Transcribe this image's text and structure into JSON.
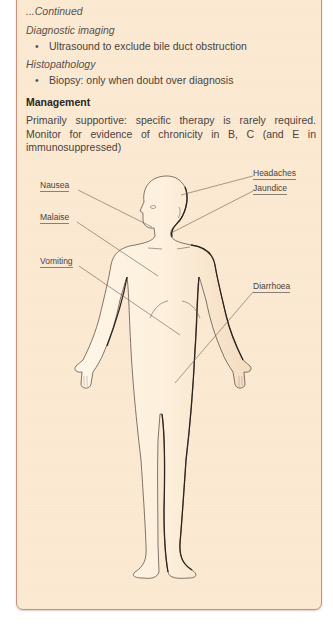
{
  "panel": {
    "continued": "...Continued",
    "sections": [
      {
        "heading": "Diagnostic imaging",
        "bullets": [
          "Ultrasound to exclude bile duct obstruction"
        ]
      },
      {
        "heading": "Histopathology",
        "bullets": [
          "Biopsy: only when doubt over diagnosis"
        ]
      }
    ],
    "management": {
      "heading": "Management",
      "text": "Primarily supportive: specific therapy is rarely required. Monitor for evidence of chronicity in B, C (and E in immunosuppressed)"
    }
  },
  "figure": {
    "labels": {
      "headaches": "Headaches",
      "jaundice": "Jaundice",
      "nausea": "Nausea",
      "malaise": "Malaise",
      "vomiting": "Vomiting",
      "diarrhoea": "Diarrhoea"
    }
  },
  "colors": {
    "panel_bg": "#fbe8d0",
    "panel_border": "#c8907a",
    "body_fill": "#fdf0dc",
    "body_outline": "#2c2420"
  }
}
